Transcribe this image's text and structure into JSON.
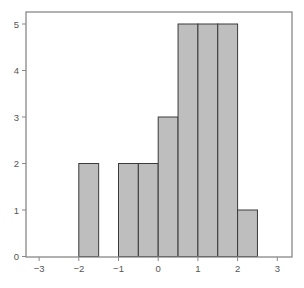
{
  "chart_data": {
    "type": "bar",
    "subtype": "histogram",
    "title": "",
    "xlabel": "",
    "ylabel": "",
    "bins": [
      {
        "x0": -2.0,
        "x1": -1.5,
        "count": 2
      },
      {
        "x0": -1.0,
        "x1": -0.5,
        "count": 2
      },
      {
        "x0": -0.5,
        "x1": 0.0,
        "count": 2
      },
      {
        "x0": 0.0,
        "x1": 0.5,
        "count": 3
      },
      {
        "x0": 0.5,
        "x1": 1.0,
        "count": 5
      },
      {
        "x0": 1.0,
        "x1": 1.5,
        "count": 5
      },
      {
        "x0": 1.5,
        "x1": 2.0,
        "count": 5
      },
      {
        "x0": 2.0,
        "x1": 2.5,
        "count": 1
      }
    ],
    "categories": [
      "-2.0–-1.5",
      "-1.0–-0.5",
      "-0.5–0.0",
      "0.0–0.5",
      "0.5–1.0",
      "1.0–1.5",
      "1.5–2.0",
      "2.0–2.5"
    ],
    "values": [
      2,
      2,
      2,
      3,
      5,
      5,
      5,
      1
    ],
    "xlim": [
      -3.33,
      3.38
    ],
    "ylim": [
      0,
      5.25
    ],
    "xticks": [
      -3,
      -2,
      -1,
      0,
      1,
      2,
      3
    ],
    "yticks": [
      0,
      1,
      2,
      3,
      4,
      5
    ],
    "grid": false,
    "legend": null,
    "colors": {
      "bar_fill": "#bebebe",
      "bar_edge": "#3a3a3a",
      "axis": "#888888",
      "tick_label": "#555555"
    }
  }
}
